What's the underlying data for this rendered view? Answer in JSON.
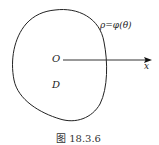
{
  "figure": {
    "curve_label": "ρ=φ(θ)",
    "origin_label": "O",
    "region_label": "D",
    "axis_label": "x",
    "caption": "图 18.3.6"
  },
  "colors": {
    "stroke": "#222222",
    "background": "#ffffff"
  }
}
